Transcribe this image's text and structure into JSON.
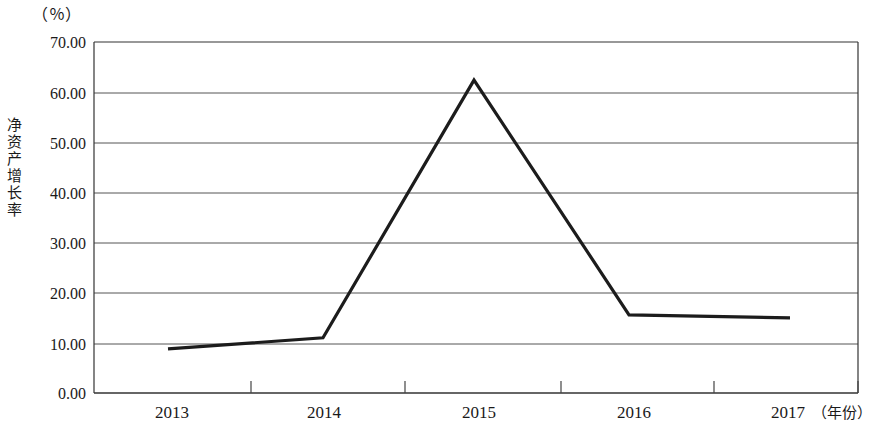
{
  "unit_label": "（％）",
  "y_axis_title_chars": [
    "净",
    "资",
    "产",
    "增",
    "长",
    "率"
  ],
  "y_axis_title": "净资产增长率",
  "x_unit_label": "（年份）",
  "axis": {
    "y_ticks": [
      "0.00",
      "10.00",
      "20.00",
      "30.00",
      "40.00",
      "50.00",
      "60.00",
      "70.00"
    ],
    "x_ticks": [
      "2013",
      "2014",
      "2015",
      "2016",
      "2017"
    ]
  },
  "chart_data": {
    "type": "line",
    "title": "",
    "xlabel": "年份",
    "ylabel": "净资产增长率",
    "unit": "%",
    "categories": [
      "2013",
      "2014",
      "2015",
      "2016",
      "2017"
    ],
    "values": [
      8.8,
      11.0,
      62.4,
      15.6,
      15.0
    ],
    "series": [
      {
        "name": "净资产增长率",
        "values": [
          8.8,
          11.0,
          62.4,
          15.6,
          15.0
        ],
        "color": "#1c1c1c"
      }
    ],
    "ylim": [
      0,
      70
    ],
    "ytick_step": 10,
    "ytick_values": [
      0,
      10,
      20,
      30,
      40,
      50,
      60,
      70
    ],
    "grid": true,
    "legend": "none",
    "marker": "none"
  },
  "colors": {
    "line": "#1c1c1c",
    "grid": "#555555",
    "frame": "#333333",
    "background": "#ffffff"
  }
}
